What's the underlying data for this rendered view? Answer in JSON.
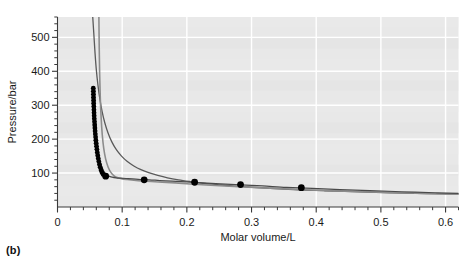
{
  "figure": {
    "panel_label": "(b)",
    "background_color": "#ffffff",
    "plot_background_color": "#e8e8e8",
    "gridline_color": "#ffffff",
    "axis_color": "#3a3a3a"
  },
  "chart_data": {
    "type": "line",
    "title": "",
    "xlabel": "Molar volume/L",
    "ylabel": "Pressure/bar",
    "xlim": [
      0,
      0.62
    ],
    "ylim": [
      0,
      560
    ],
    "grid": true,
    "legend": "none",
    "x_ticks": [
      0,
      0.1,
      0.2,
      0.3,
      0.4,
      0.5,
      0.6
    ],
    "x_tick_labels": [
      "0",
      "0.1",
      "0.2",
      "0.3",
      "0.4",
      "0.5",
      "0.6"
    ],
    "x_minor_tick_step": 0.02,
    "y_ticks": [
      100,
      200,
      300,
      400,
      500
    ],
    "y_tick_labels": [
      "100",
      "200",
      "300",
      "400",
      "500"
    ],
    "y_minor_tick_step": 20,
    "series": [
      {
        "name": "upper-isotherm",
        "type": "line",
        "color": "#5a5a5a",
        "width": 1.3,
        "points": [
          [
            0.0545,
            560
          ],
          [
            0.056,
            515
          ],
          [
            0.058,
            455
          ],
          [
            0.06,
            405
          ],
          [
            0.0625,
            360
          ],
          [
            0.0655,
            318
          ],
          [
            0.069,
            281
          ],
          [
            0.073,
            249
          ],
          [
            0.078,
            219
          ],
          [
            0.084,
            192
          ],
          [
            0.091,
            169
          ],
          [
            0.099,
            150
          ],
          [
            0.108,
            134
          ],
          [
            0.118,
            121
          ],
          [
            0.129,
            110
          ],
          [
            0.141,
            101
          ],
          [
            0.155,
            93
          ],
          [
            0.17,
            86
          ],
          [
            0.187,
            80
          ],
          [
            0.205,
            75
          ],
          [
            0.225,
            70
          ],
          [
            0.247,
            66
          ],
          [
            0.27,
            62
          ],
          [
            0.295,
            59
          ],
          [
            0.322,
            56
          ],
          [
            0.35,
            53
          ],
          [
            0.38,
            50
          ],
          [
            0.412,
            48
          ],
          [
            0.445,
            46
          ],
          [
            0.48,
            44
          ],
          [
            0.517,
            42
          ],
          [
            0.555,
            40
          ],
          [
            0.595,
            39
          ],
          [
            0.62,
            38
          ]
        ]
      },
      {
        "name": "middle-isotherm",
        "type": "line",
        "color": "#8c8c8c",
        "width": 1.6,
        "points": [
          [
            0.064,
            560
          ],
          [
            0.0645,
            470
          ],
          [
            0.0652,
            390
          ],
          [
            0.0662,
            320
          ],
          [
            0.0675,
            262
          ],
          [
            0.0692,
            213
          ],
          [
            0.0715,
            173
          ],
          [
            0.0745,
            141
          ],
          [
            0.0782,
            118
          ],
          [
            0.0825,
            102
          ],
          [
            0.0875,
            92
          ],
          [
            0.0935,
            86
          ],
          [
            0.1,
            83
          ],
          [
            0.108,
            81
          ],
          [
            0.118,
            79
          ],
          [
            0.13,
            77
          ],
          [
            0.145,
            75
          ],
          [
            0.162,
            73
          ],
          [
            0.182,
            71
          ],
          [
            0.205,
            68
          ],
          [
            0.23,
            65
          ],
          [
            0.258,
            62
          ],
          [
            0.288,
            59
          ],
          [
            0.32,
            56
          ],
          [
            0.355,
            53
          ],
          [
            0.392,
            50
          ],
          [
            0.43,
            47
          ],
          [
            0.47,
            45
          ],
          [
            0.51,
            43
          ],
          [
            0.552,
            41
          ],
          [
            0.595,
            39
          ],
          [
            0.62,
            38
          ]
        ]
      },
      {
        "name": "lower-isotherm",
        "type": "line",
        "color": "#4a4a4a",
        "width": 1.2,
        "points": [
          [
            0.0575,
            350
          ],
          [
            0.0578,
            315
          ],
          [
            0.0583,
            280
          ],
          [
            0.059,
            248
          ],
          [
            0.06,
            216
          ],
          [
            0.0613,
            188
          ],
          [
            0.063,
            162
          ],
          [
            0.0652,
            140
          ],
          [
            0.068,
            121
          ],
          [
            0.0712,
            107
          ],
          [
            0.075,
            97
          ],
          [
            0.0795,
            91
          ],
          [
            0.0845,
            88
          ],
          [
            0.0905,
            86
          ],
          [
            0.0975,
            85
          ],
          [
            0.106,
            84
          ],
          [
            0.116,
            83
          ],
          [
            0.128,
            81
          ],
          [
            0.142,
            80
          ],
          [
            0.158,
            78
          ],
          [
            0.177,
            76
          ],
          [
            0.199,
            74
          ],
          [
            0.224,
            71
          ],
          [
            0.252,
            68
          ],
          [
            0.283,
            65
          ],
          [
            0.317,
            62
          ],
          [
            0.354,
            58
          ],
          [
            0.394,
            55
          ],
          [
            0.437,
            51
          ],
          [
            0.483,
            48
          ],
          [
            0.532,
            45
          ],
          [
            0.584,
            42
          ],
          [
            0.62,
            40
          ]
        ]
      }
    ],
    "markers": {
      "name": "data-points",
      "color": "#000000",
      "shape": "circle",
      "cluster": {
        "description": "dense vertical chain of points on the steep branch",
        "radius": 2.4,
        "points": [
          [
            0.0553,
            350
          ],
          [
            0.0554,
            341
          ],
          [
            0.0555,
            332
          ],
          [
            0.0556,
            323
          ],
          [
            0.0558,
            314
          ],
          [
            0.0559,
            305
          ],
          [
            0.0561,
            296
          ],
          [
            0.0563,
            287
          ],
          [
            0.0565,
            278
          ],
          [
            0.0567,
            269
          ],
          [
            0.0569,
            260
          ],
          [
            0.0572,
            251
          ],
          [
            0.0575,
            242
          ],
          [
            0.0578,
            233
          ],
          [
            0.0581,
            224
          ],
          [
            0.0585,
            215
          ],
          [
            0.0589,
            206
          ],
          [
            0.0593,
            197
          ],
          [
            0.0598,
            188
          ],
          [
            0.0603,
            179
          ],
          [
            0.0609,
            170
          ],
          [
            0.0615,
            161
          ],
          [
            0.0622,
            152
          ],
          [
            0.063,
            143
          ],
          [
            0.0639,
            134
          ],
          [
            0.0649,
            125
          ],
          [
            0.066,
            117
          ],
          [
            0.0673,
            109
          ],
          [
            0.0688,
            102
          ],
          [
            0.0706,
            96
          ]
        ]
      },
      "isolated": {
        "radius": 3.4,
        "points": [
          [
            0.0745,
            91
          ],
          [
            0.134,
            80
          ],
          [
            0.212,
            73
          ],
          [
            0.283,
            66
          ],
          [
            0.377,
            57
          ]
        ]
      }
    }
  }
}
